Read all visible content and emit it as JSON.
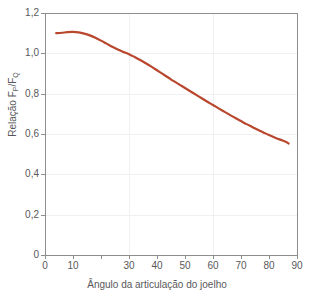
{
  "chart_data": {
    "type": "line",
    "title": "",
    "xlabel": "Ângulo da articulação do joelho",
    "ylabel": "Relação F",
    "ylabel_sub1": "P",
    "ylabel_mid": "/F",
    "ylabel_sub2": "Q",
    "ylabel_full": "Relação FP/FQ",
    "xlim": [
      0,
      90
    ],
    "ylim": [
      0,
      1.2
    ],
    "grid": true,
    "legend": "none",
    "line_color": "#b8472e",
    "axis_color": "#8d8d8f",
    "grid_color": "#f0f0f2",
    "text_color": "#58585a",
    "xticks": [
      0,
      10,
      20,
      30,
      40,
      50,
      60,
      70,
      80,
      90
    ],
    "xtick_labels": [
      "0",
      "10",
      "",
      "30",
      "40",
      "50",
      "60",
      "70",
      "80",
      "90"
    ],
    "yticks": [
      0,
      0.2,
      0.4,
      0.6,
      0.8,
      1.0,
      1.2
    ],
    "ytick_labels": [
      "0",
      "0,2",
      "0,4",
      "0,6",
      "0,8",
      "1,0",
      "1,2"
    ],
    "series": [
      {
        "name": "Relação FP/FQ",
        "x": [
          4,
          6,
          8,
          10,
          12,
          14,
          16,
          18,
          20,
          22,
          24,
          26,
          28,
          30,
          32,
          34,
          36,
          38,
          40,
          42,
          44,
          46,
          48,
          50,
          52,
          54,
          56,
          58,
          60,
          62,
          64,
          66,
          68,
          70,
          72,
          74,
          76,
          78,
          80,
          82,
          84,
          86,
          87
        ],
        "y": [
          1.1,
          1.102,
          1.105,
          1.106,
          1.104,
          1.098,
          1.089,
          1.077,
          1.063,
          1.048,
          1.033,
          1.019,
          1.007,
          0.996,
          0.982,
          0.967,
          0.951,
          0.934,
          0.916,
          0.898,
          0.88,
          0.862,
          0.845,
          0.828,
          0.811,
          0.794,
          0.777,
          0.76,
          0.744,
          0.727,
          0.711,
          0.695,
          0.679,
          0.664,
          0.649,
          0.635,
          0.621,
          0.608,
          0.595,
          0.583,
          0.572,
          0.562,
          0.553
        ]
      }
    ]
  }
}
